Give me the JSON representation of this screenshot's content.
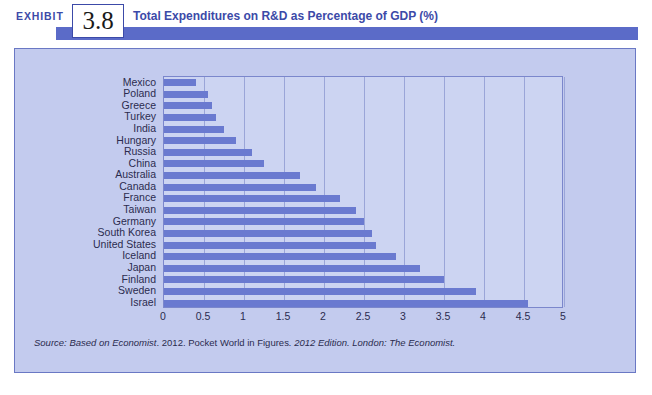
{
  "exhibit": {
    "label": "EXHIBIT",
    "number": "3.8",
    "title": "Total Expenditures on R&D as Percentage of GDP (%)"
  },
  "source": {
    "prefix": "Source:",
    "text": "Based on Economist. 2012. Pocket World in Figures. 2012 Edition. London: The Economist.",
    "full": "Source: Based on Economist. 2012. Pocket World in Figures. 2012 Edition. London: The Economist."
  },
  "colors": {
    "bar": "#6a7ad0",
    "panel_bg": "#c3cbee",
    "plot_bg": "#ccd4f2",
    "accent": "#3c4aa8",
    "band": "#5b6bc8",
    "grid": "#9aa5d8",
    "axis": "#7b87cc"
  },
  "chart_data": {
    "type": "bar",
    "orientation": "horizontal",
    "title": "Total Expenditures on R&D as Percentage of GDP (%)",
    "xlabel": "",
    "ylabel": "",
    "xlim": [
      0,
      5
    ],
    "xticks": [
      "0",
      "0.5",
      "1",
      "1.5",
      "2",
      "2.5",
      "3",
      "3.5",
      "4",
      "4.5",
      "5"
    ],
    "xtick_values": [
      0,
      0.5,
      1,
      1.5,
      2,
      2.5,
      3,
      3.5,
      4,
      4.5,
      5
    ],
    "grid": true,
    "legend": false,
    "units": "percent of GDP",
    "categories": [
      "Mexico",
      "Poland",
      "Greece",
      "Turkey",
      "India",
      "Hungary",
      "Russia",
      "China",
      "Australia",
      "Canada",
      "France",
      "Taiwan",
      "Germany",
      "South Korea",
      "United States",
      "Iceland",
      "Japan",
      "Finland",
      "Sweden",
      "Israel"
    ],
    "values": [
      0.4,
      0.55,
      0.6,
      0.65,
      0.75,
      0.9,
      1.1,
      1.25,
      1.7,
      1.9,
      2.2,
      2.4,
      2.5,
      2.6,
      2.65,
      2.9,
      3.2,
      3.5,
      3.9,
      4.55
    ]
  }
}
